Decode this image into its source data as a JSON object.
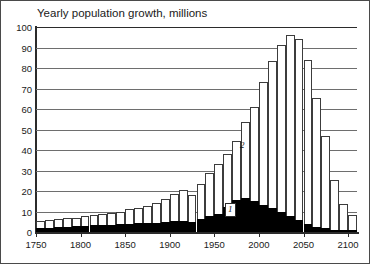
{
  "chart_data": {
    "type": "bar",
    "stacked": true,
    "title": "Yearly population growth, millions",
    "xlabel": "",
    "ylabel": "",
    "ylim": [
      0,
      100
    ],
    "xlim": [
      1750,
      2110
    ],
    "ytick_step": 10,
    "xtick_step": 50,
    "grid": true,
    "legend_position": "inline-annotations",
    "bin_width_years": 10,
    "yticks": [
      "0",
      "10",
      "20",
      "30",
      "40",
      "50",
      "60",
      "70",
      "80",
      "90",
      "100"
    ],
    "xticks": [
      "1750",
      "1800",
      "1850",
      "1900",
      "1950",
      "2000",
      "2050",
      "2100"
    ],
    "annotations": [
      {
        "label": "1",
        "series": "Less developed regions (black, lower)"
      },
      {
        "label": "2",
        "series": "Total world (white, upper)"
      }
    ],
    "colors": {
      "series_lower": "#000000",
      "series_upper": "#ffffff",
      "outline": "#3c3c3c",
      "grid": "#6e6e6e",
      "axis": "#2b2b2b",
      "text": "#1a1a1a"
    },
    "categories": [
      "1750",
      "1760",
      "1770",
      "1780",
      "1790",
      "1800",
      "1810",
      "1820",
      "1830",
      "1840",
      "1850",
      "1860",
      "1870",
      "1880",
      "1890",
      "1900",
      "1910",
      "1920",
      "1930",
      "1940",
      "1950",
      "1960",
      "1970",
      "1980",
      "1990",
      "2000",
      "2010",
      "2020",
      "2030",
      "2040",
      "2050",
      "2060",
      "2070",
      "2080",
      "2090",
      "2100"
    ],
    "series": [
      {
        "name": "1",
        "values": [
          2.0,
          2.2,
          2.4,
          2.6,
          2.8,
          3.0,
          3.2,
          3.4,
          3.6,
          3.8,
          4.0,
          4.2,
          4.4,
          4.6,
          5.0,
          5.4,
          5.6,
          5.0,
          6.4,
          7.6,
          9.0,
          12.0,
          15.5,
          16.5,
          15.0,
          13.0,
          11.5,
          10.0,
          8.0,
          6.0,
          4.0,
          2.6,
          1.8,
          1.2,
          0.8,
          0.5
        ]
      },
      {
        "name": "2",
        "values": [
          3.5,
          3.6,
          3.8,
          4.0,
          4.2,
          4.6,
          5.0,
          5.4,
          5.8,
          6.2,
          7.0,
          7.6,
          8.4,
          9.4,
          11.0,
          13.0,
          15.0,
          13.0,
          17.0,
          21.0,
          24.0,
          26.0,
          29.0,
          37.0,
          46.0,
          60.0,
          72.0,
          81.0,
          88.0,
          88.0,
          80.0,
          63.0,
          45.0,
          24.0,
          13.0,
          8.0
        ]
      }
    ],
    "totals": [
      5.5,
      5.8,
      6.2,
      6.6,
      7.0,
      7.6,
      8.2,
      8.8,
      9.4,
      10.0,
      11.0,
      11.8,
      12.8,
      14.0,
      16.0,
      18.4,
      20.6,
      18.0,
      23.4,
      28.6,
      33.0,
      38.0,
      44.5,
      53.5,
      61.0,
      73.0,
      83.5,
      91.0,
      96.0,
      94.0,
      84.0,
      65.6,
      46.8,
      25.2,
      13.8,
      8.5
    ]
  }
}
